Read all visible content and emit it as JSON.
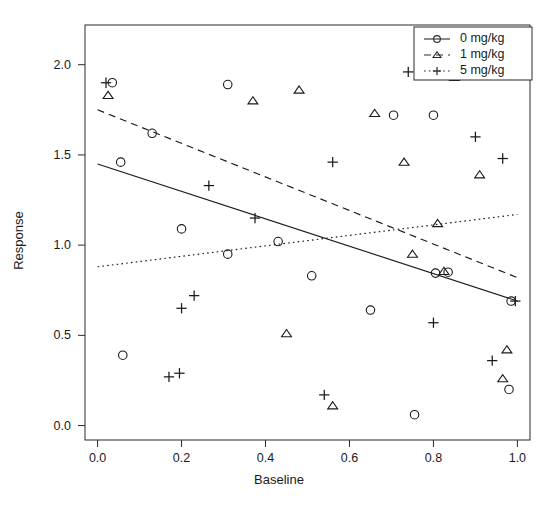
{
  "chart_data": {
    "type": "scatter",
    "title": "",
    "xlabel": "Baseline",
    "ylabel": "Response",
    "xlim": [
      -0.03,
      1.03
    ],
    "ylim": [
      -0.08,
      2.22
    ],
    "xticks": [
      0.0,
      0.2,
      0.4,
      0.6,
      0.8,
      1.0
    ],
    "xticklabels": [
      "0.0",
      "0.2",
      "0.4",
      "0.6",
      "0.8",
      "1.0"
    ],
    "yticks": [
      0.0,
      0.5,
      1.0,
      1.5,
      2.0
    ],
    "yticklabels": [
      "0.0",
      "0.5",
      "1.0",
      "1.5",
      "2.0"
    ],
    "grid": false,
    "legend_position": "top-right",
    "series": [
      {
        "name": "0 mg/kg",
        "marker": "circle",
        "linestyle": "solid",
        "color": "#1a1a1a",
        "points": [
          [
            0.035,
            1.9
          ],
          [
            0.055,
            1.46
          ],
          [
            0.13,
            1.62
          ],
          [
            0.06,
            0.39
          ],
          [
            0.2,
            1.09
          ],
          [
            0.31,
            1.89
          ],
          [
            0.31,
            0.95
          ],
          [
            0.43,
            1.02
          ],
          [
            0.51,
            0.83
          ],
          [
            0.65,
            0.64
          ],
          [
            0.705,
            1.72
          ],
          [
            0.755,
            0.06
          ],
          [
            0.8,
            1.72
          ],
          [
            0.805,
            0.845
          ],
          [
            0.835,
            0.85
          ],
          [
            0.985,
            0.69
          ],
          [
            0.98,
            0.2
          ]
        ],
        "fit_line": {
          "x0": 0.0,
          "y0": 1.45,
          "x1": 1.0,
          "y1": 0.69
        }
      },
      {
        "name": "1 mg/kg",
        "marker": "triangle",
        "linestyle": "dashed",
        "color": "#1a1a1a",
        "points": [
          [
            0.025,
            1.83
          ],
          [
            0.37,
            1.8
          ],
          [
            0.45,
            0.51
          ],
          [
            0.48,
            1.86
          ],
          [
            0.56,
            0.11
          ],
          [
            0.66,
            1.73
          ],
          [
            0.73,
            1.46
          ],
          [
            0.75,
            0.95
          ],
          [
            0.81,
            1.12
          ],
          [
            0.825,
            0.855
          ],
          [
            0.85,
            1.93
          ],
          [
            0.91,
            1.39
          ],
          [
            0.965,
            0.26
          ],
          [
            0.975,
            0.42
          ]
        ],
        "fit_line": {
          "x0": 0.0,
          "y0": 1.75,
          "x1": 1.0,
          "y1": 0.82
        }
      },
      {
        "name": "5 mg/kg",
        "marker": "plus",
        "linestyle": "dotted",
        "color": "#1a1a1a",
        "points": [
          [
            0.02,
            1.9
          ],
          [
            0.17,
            0.27
          ],
          [
            0.195,
            0.29
          ],
          [
            0.2,
            0.65
          ],
          [
            0.23,
            0.72
          ],
          [
            0.265,
            1.33
          ],
          [
            0.375,
            1.15
          ],
          [
            0.54,
            0.17
          ],
          [
            0.56,
            1.46
          ],
          [
            0.74,
            1.96
          ],
          [
            0.79,
            1.955
          ],
          [
            0.8,
            0.57
          ],
          [
            0.9,
            1.6
          ],
          [
            0.94,
            0.36
          ],
          [
            0.965,
            1.48
          ],
          [
            0.995,
            0.69
          ]
        ],
        "fit_line": {
          "x0": 0.0,
          "y0": 0.88,
          "x1": 1.0,
          "y1": 1.17
        }
      }
    ],
    "legend": [
      {
        "label": "0 mg/kg",
        "marker": "circle",
        "linestyle": "solid"
      },
      {
        "label": "1 mg/kg",
        "marker": "triangle",
        "linestyle": "dashed"
      },
      {
        "label": "5 mg/kg",
        "marker": "plus",
        "linestyle": "dotted"
      }
    ]
  }
}
